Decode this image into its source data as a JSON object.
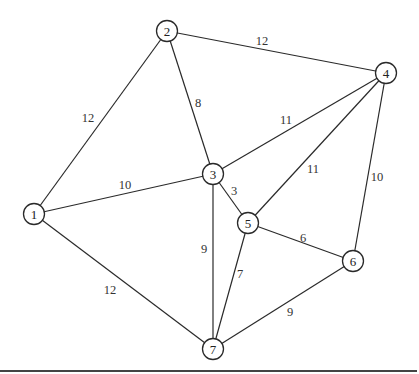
{
  "graph": {
    "nodes": [
      {
        "id": "1",
        "label": "1",
        "x": 34,
        "y": 214
      },
      {
        "id": "2",
        "label": "2",
        "x": 167,
        "y": 31
      },
      {
        "id": "3",
        "label": "3",
        "x": 213,
        "y": 174
      },
      {
        "id": "4",
        "label": "4",
        "x": 386,
        "y": 73
      },
      {
        "id": "5",
        "label": "5",
        "x": 248,
        "y": 223
      },
      {
        "id": "6",
        "label": "6",
        "x": 353,
        "y": 261
      },
      {
        "id": "7",
        "label": "7",
        "x": 213,
        "y": 349
      }
    ],
    "edges": [
      {
        "from": "1",
        "to": "2",
        "weight": "12",
        "lx": 88,
        "ly": 118
      },
      {
        "from": "2",
        "to": "4",
        "weight": "12",
        "lx": 262,
        "ly": 41
      },
      {
        "from": "2",
        "to": "3",
        "weight": "8",
        "lx": 198,
        "ly": 103
      },
      {
        "from": "1",
        "to": "3",
        "weight": "10",
        "lx": 125,
        "ly": 185
      },
      {
        "from": "3",
        "to": "4",
        "weight": "11",
        "lx": 286,
        "ly": 120
      },
      {
        "from": "4",
        "to": "5",
        "weight": "11",
        "lx": 313,
        "ly": 169
      },
      {
        "from": "4",
        "to": "6",
        "weight": "10",
        "lx": 377,
        "ly": 177
      },
      {
        "from": "3",
        "to": "5",
        "weight": "3",
        "lx": 234,
        "ly": 191
      },
      {
        "from": "5",
        "to": "6",
        "weight": "6",
        "lx": 303,
        "ly": 238
      },
      {
        "from": "3",
        "to": "7",
        "weight": "9",
        "lx": 204,
        "ly": 249
      },
      {
        "from": "5",
        "to": "7",
        "weight": "7",
        "lx": 240,
        "ly": 274
      },
      {
        "from": "1",
        "to": "7",
        "weight": "12",
        "lx": 110,
        "ly": 290
      },
      {
        "from": "6",
        "to": "7",
        "weight": "9",
        "lx": 290,
        "ly": 312
      }
    ],
    "node_radius": 10.5
  }
}
